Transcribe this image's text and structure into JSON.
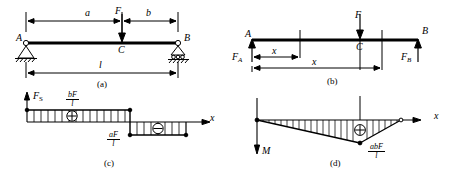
{
  "figure": {
    "stroke_color": "#000000",
    "background_color": "#ffffff"
  },
  "panels": [
    {
      "id": "a",
      "caption": "(a)",
      "labels": {
        "support_a": "A",
        "support_b": "B",
        "load": "F",
        "point_c": "C",
        "dim_a": "a",
        "dim_b": "b",
        "dim_l": "l"
      }
    },
    {
      "id": "b",
      "caption": "(b)",
      "labels": {
        "end_a": "A",
        "end_b": "B",
        "load": "F",
        "point_c": "C",
        "reaction_a": "F",
        "reaction_a_sub": "A",
        "reaction_b": "F",
        "reaction_b_sub": "B",
        "dim_x_left": "x",
        "dim_x_right": "x"
      }
    },
    {
      "id": "c",
      "caption": "(c)",
      "labels": {
        "axis_y": "F",
        "axis_y_sub": "S",
        "axis_x": "x",
        "positive_sign": "⊕",
        "negative_sign": "⊖"
      },
      "values": {
        "positive_peak_num": "bF",
        "positive_peak_den": "l",
        "negative_peak_num": "aF",
        "negative_peak_den": "l"
      }
    },
    {
      "id": "d",
      "caption": "(d)",
      "labels": {
        "axis_y": "M",
        "axis_x": "x",
        "positive_sign": "⊕"
      },
      "values": {
        "max_moment_num": "abF",
        "max_moment_den": "l"
      }
    }
  ]
}
